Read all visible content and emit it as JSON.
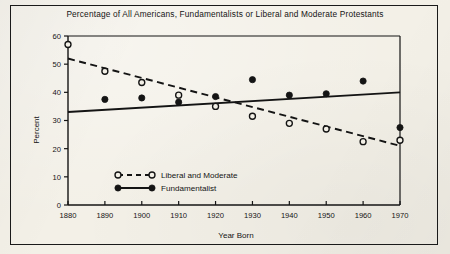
{
  "figure": {
    "background_color": "#f3f0e7",
    "border_color": "#1a1a1a",
    "ink_color": "#141414"
  },
  "chart_data": {
    "type": "scatter",
    "title": "Percentage of All Americans, Fundamentalists or Liberal and Moderate Protestants",
    "xlabel": "Year Born",
    "ylabel": "Percent",
    "xlim": [
      1880,
      1970
    ],
    "ylim": [
      0,
      60
    ],
    "xticks": [
      1880,
      1890,
      1900,
      1910,
      1920,
      1930,
      1940,
      1950,
      1960,
      1970
    ],
    "yticks": [
      0,
      10,
      20,
      30,
      40,
      50,
      60
    ],
    "grid": false,
    "legend_position": "lower-left-inside",
    "x": [
      1880,
      1890,
      1900,
      1910,
      1920,
      1930,
      1940,
      1950,
      1960,
      1970
    ],
    "series": [
      {
        "name": "Liberal and Moderate",
        "marker": "open-circle",
        "linestyle": "dashed",
        "color": "#141414",
        "values": [
          57.0,
          47.5,
          43.5,
          39.0,
          35.0,
          31.5,
          29.0,
          27.0,
          22.5,
          23.0
        ],
        "trendline": {
          "x": [
            1880,
            1970
          ],
          "y": [
            52.0,
            21.0
          ]
        }
      },
      {
        "name": "Fundamentalist",
        "marker": "filled-circle",
        "linestyle": "solid",
        "color": "#141414",
        "values": [
          null,
          37.5,
          38.0,
          36.5,
          38.5,
          44.5,
          39.0,
          39.5,
          44.0,
          27.5
        ],
        "trendline": {
          "x": [
            1880,
            1970
          ],
          "y": [
            33.0,
            40.0
          ]
        }
      }
    ]
  },
  "legend": {
    "items": [
      {
        "label": "Liberal and Moderate",
        "marker": "open-circle",
        "linestyle": "dashed"
      },
      {
        "label": "Fundamentalist",
        "marker": "filled-circle",
        "linestyle": "solid"
      }
    ]
  }
}
